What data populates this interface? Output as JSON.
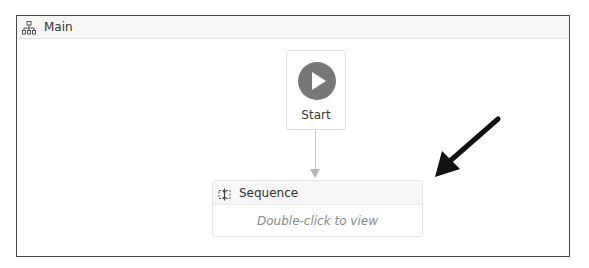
{
  "header": {
    "title": "Main",
    "icon": "workflow-tree-icon"
  },
  "start_node": {
    "label": "Start",
    "icon": "play-circle-icon",
    "icon_color": "#777777"
  },
  "sequence_node": {
    "title": "Sequence",
    "icon": "sequence-icon",
    "hint": "Double-click to view"
  },
  "annotation": {
    "icon": "black-arrow-pointer-icon",
    "color": "#111111"
  }
}
